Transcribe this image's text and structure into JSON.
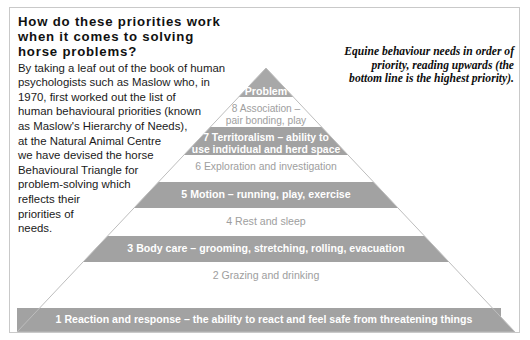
{
  "colors": {
    "band_gray": "#a2a2a2",
    "pyramid_gray": "#a8a8a8",
    "frame_border": "#c9c9c9",
    "white_text": "#ffffff",
    "gray_text": "#9e9e9e",
    "body_text": "#1a1a1a",
    "background": "#ffffff"
  },
  "article": {
    "heading_lines": [
      "How do these priorities",
      "work when it comes to",
      "solving horse problems?"
    ],
    "body_lines": [
      "By taking a leaf out of the book of human",
      "psychologists such as Maslow who, in",
      "1970, first worked out the list of",
      "human behavioural priorities (known",
      "as Maslow's Hierarchy of Needs),",
      "at the Natural Animal Centre",
      "we have devised the horse",
      "Behavioural Triangle for",
      "problem-solving which",
      "reflects their",
      "priorities of",
      "needs."
    ]
  },
  "caption": {
    "lines": [
      "Equine behaviour needs in order of",
      "priority, reading upwards (the",
      "bottom line is the highest priority)."
    ]
  },
  "pyramid": {
    "apex_label": "Problem",
    "tiers": [
      {
        "id": "tier-problem",
        "style": "band",
        "lines": [
          "Problem"
        ]
      },
      {
        "id": "tier-8-association",
        "style": "white",
        "lines": [
          "8 Association –",
          "pair bonding, play"
        ]
      },
      {
        "id": "tier-7-territoralism",
        "style": "band",
        "lines": [
          "7 Territoralism – ability to",
          "use individual and herd space"
        ]
      },
      {
        "id": "tier-6-exploration",
        "style": "white",
        "lines": [
          "6 Exploration and investigation"
        ]
      },
      {
        "id": "tier-5-motion",
        "style": "band",
        "lines": [
          "5 Motion – running, play, exercise"
        ]
      },
      {
        "id": "tier-4-rest",
        "style": "white",
        "lines": [
          "4 Rest and sleep"
        ]
      },
      {
        "id": "tier-3-body-care",
        "style": "band",
        "lines": [
          "3 Body care – grooming, stretching, rolling, evacuation"
        ]
      },
      {
        "id": "tier-2-grazing",
        "style": "white",
        "lines": [
          "2 Grazing and drinking"
        ]
      },
      {
        "id": "tier-1-reaction",
        "style": "band",
        "lines": [
          "1 Reaction and response – the ability to react and feel safe from threatening things"
        ]
      }
    ]
  }
}
